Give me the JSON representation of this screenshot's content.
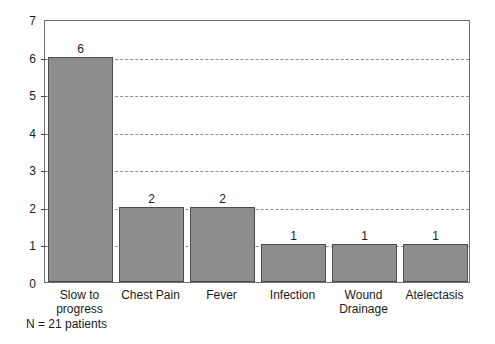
{
  "chart_data": {
    "type": "bar",
    "title": "",
    "xlabel": "",
    "ylabel": "",
    "ylim": [
      0,
      7
    ],
    "ytick_labels": [
      "0",
      "1",
      "2",
      "3",
      "4",
      "5",
      "6",
      "7"
    ],
    "ytick_values": [
      0,
      1,
      2,
      3,
      4,
      5,
      6,
      7
    ],
    "grid": "horizontal-dashed",
    "legend": "none",
    "categories": [
      "Slow to\nprogress",
      "Chest Pain",
      "Fever",
      "Infection",
      "Wound\nDrainage",
      "Atelectasis"
    ],
    "values": [
      6,
      2,
      2,
      1,
      1,
      1
    ],
    "value_labels": [
      "6",
      "2",
      "2",
      "1",
      "1",
      "1"
    ],
    "bar_color": "#8d8d8d",
    "bar_edge_color": "#4d4d4d",
    "grid_color": "#8d8d8d",
    "axis_color": "#6f6f6f",
    "text_color": "#1b1b1b",
    "background": "#ffffff"
  },
  "caption": {
    "text": "N = 21 patients"
  }
}
